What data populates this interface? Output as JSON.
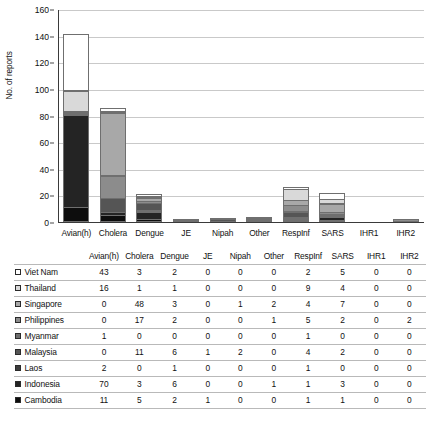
{
  "chart_data": {
    "type": "bar",
    "subtype": "stacked-bar",
    "title": "",
    "xlabel": "",
    "ylabel": "No. of reports",
    "ylim": [
      0,
      160
    ],
    "ytick_step": 20,
    "yticks": [
      "0",
      "20",
      "40",
      "60",
      "80",
      "100",
      "120",
      "140",
      "160"
    ],
    "grid": true,
    "legend_position": "table-row-headers",
    "categories": [
      "Avian(h)",
      "Cholera",
      "Dengue",
      "JE",
      "Nipah",
      "Other",
      "RespInf",
      "SARS",
      "IHR1",
      "IHR2"
    ],
    "series": [
      {
        "name": "Viet Nam",
        "color": "#ffffff",
        "values": [
          43,
          3,
          2,
          0,
          0,
          0,
          2,
          5,
          0,
          0
        ]
      },
      {
        "name": "Thailand",
        "color": "#d9d9d9",
        "values": [
          16,
          1,
          1,
          0,
          0,
          0,
          9,
          4,
          0,
          0
        ]
      },
      {
        "name": "Singapore",
        "color": "#a8a8a8",
        "values": [
          0,
          48,
          3,
          0,
          1,
          2,
          4,
          7,
          0,
          0
        ]
      },
      {
        "name": "Philippines",
        "color": "#8c8c8c",
        "values": [
          0,
          17,
          2,
          0,
          0,
          1,
          5,
          2,
          0,
          2
        ]
      },
      {
        "name": "Myanmar",
        "color": "#6e6e6e",
        "values": [
          1,
          0,
          0,
          0,
          0,
          0,
          1,
          0,
          0,
          0
        ]
      },
      {
        "name": "Malaysia",
        "color": "#555555",
        "values": [
          0,
          11,
          6,
          1,
          2,
          0,
          4,
          2,
          0,
          0
        ]
      },
      {
        "name": "Laos",
        "color": "#3d3d3d",
        "values": [
          2,
          0,
          1,
          0,
          0,
          0,
          1,
          0,
          0,
          0
        ]
      },
      {
        "name": "Indonesia",
        "color": "#242424",
        "values": [
          70,
          3,
          6,
          0,
          0,
          1,
          1,
          3,
          0,
          0
        ]
      },
      {
        "name": "Cambodia",
        "color": "#0d0d0d",
        "values": [
          11,
          5,
          2,
          1,
          0,
          0,
          1,
          1,
          0,
          0
        ]
      }
    ],
    "column_totals": [
      143,
      88,
      23,
      2,
      3,
      4,
      28,
      24,
      0,
      2
    ]
  },
  "table": {
    "row_header_label": "",
    "columns": [
      "Avian(h)",
      "Cholera",
      "Dengue",
      "JE",
      "Nipah",
      "Other",
      "RespInf",
      "SARS",
      "IHR1",
      "IHR2"
    ],
    "rows": [
      {
        "country": "Viet Nam",
        "swatch": "#ffffff",
        "values": [
          "43",
          "3",
          "2",
          "0",
          "0",
          "0",
          "2",
          "5",
          "0",
          "0"
        ]
      },
      {
        "country": "Thailand",
        "swatch": "#d9d9d9",
        "values": [
          "16",
          "1",
          "1",
          "0",
          "0",
          "0",
          "9",
          "4",
          "0",
          "0"
        ]
      },
      {
        "country": "Singapore",
        "swatch": "#a8a8a8",
        "values": [
          "0",
          "48",
          "3",
          "0",
          "1",
          "2",
          "4",
          "7",
          "0",
          "0"
        ]
      },
      {
        "country": "Philippines",
        "swatch": "#8c8c8c",
        "values": [
          "0",
          "17",
          "2",
          "0",
          "0",
          "1",
          "5",
          "2",
          "0",
          "2"
        ]
      },
      {
        "country": "Myanmar",
        "swatch": "#6e6e6e",
        "values": [
          "1",
          "0",
          "0",
          "0",
          "0",
          "0",
          "1",
          "0",
          "0",
          "0"
        ]
      },
      {
        "country": "Malaysia",
        "swatch": "#555555",
        "values": [
          "0",
          "11",
          "6",
          "1",
          "2",
          "0",
          "4",
          "2",
          "0",
          "0"
        ]
      },
      {
        "country": "Laos",
        "swatch": "#3d3d3d",
        "values": [
          "2",
          "0",
          "1",
          "0",
          "0",
          "0",
          "1",
          "0",
          "0",
          "0"
        ]
      },
      {
        "country": "Indonesia",
        "swatch": "#242424",
        "values": [
          "70",
          "3",
          "6",
          "0",
          "0",
          "1",
          "1",
          "3",
          "0",
          "0"
        ]
      },
      {
        "country": "Cambodia",
        "swatch": "#0d0d0d",
        "values": [
          "11",
          "5",
          "2",
          "1",
          "0",
          "0",
          "1",
          "1",
          "0",
          "0"
        ]
      }
    ]
  }
}
